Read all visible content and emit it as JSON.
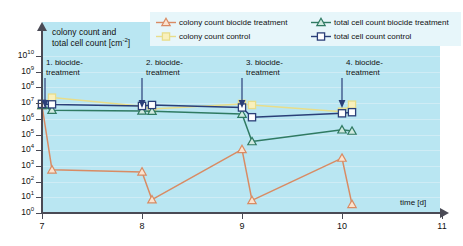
{
  "chart_data": {
    "type": "line",
    "title": "",
    "xlabel": "time [d]",
    "ylabel": "colony count and total cell count [cm⁻²]",
    "ylabel_line1": "colony count and",
    "ylabel_line2": "total cell count [cm",
    "ylabel_exp": "-2",
    "ylabel_line2_end": "]",
    "xlim": [
      7,
      11
    ],
    "ylim_log10": [
      0,
      10
    ],
    "xticks": [
      "7",
      "8",
      "9",
      "10",
      "11"
    ],
    "yticks": [
      "10⁰",
      "10¹",
      "10²",
      "10³",
      "10⁴",
      "10⁵",
      "10⁶",
      "10⁷",
      "10⁸",
      "10⁹",
      "10¹⁰"
    ],
    "ytick_exponents": [
      "0",
      "1",
      "2",
      "3",
      "4",
      "5",
      "6",
      "7",
      "8",
      "9",
      "10"
    ],
    "grid": true,
    "legend_position": "top",
    "background_color": "#b9e6f2",
    "series": [
      {
        "name": "colony count biocide treatment",
        "color": "#d98b63",
        "marker": "triangle",
        "marker_fill": "#fbe3cf",
        "points": [
          {
            "x": 7.0,
            "y_log10": 6.85
          },
          {
            "x": 7.1,
            "y_log10": 2.75
          },
          {
            "x": 8.0,
            "y_log10": 2.62
          },
          {
            "x": 8.1,
            "y_log10": 0.85
          },
          {
            "x": 9.0,
            "y_log10": 4.05
          },
          {
            "x": 9.1,
            "y_log10": 0.8
          },
          {
            "x": 10.0,
            "y_log10": 3.5
          },
          {
            "x": 10.1,
            "y_log10": 0.55
          }
        ]
      },
      {
        "name": "colony count control",
        "color": "#e8dd8a",
        "marker": "square",
        "marker_fill": "#f9f0bc",
        "points": [
          {
            "x": 7.0,
            "y_log10": 6.95
          },
          {
            "x": 7.1,
            "y_log10": 7.35
          },
          {
            "x": 8.0,
            "y_log10": 6.8
          },
          {
            "x": 8.1,
            "y_log10": 6.62
          },
          {
            "x": 9.0,
            "y_log10": 6.95
          },
          {
            "x": 9.1,
            "y_log10": 6.88
          },
          {
            "x": 10.0,
            "y_log10": 6.45
          },
          {
            "x": 10.1,
            "y_log10": 6.9
          }
        ]
      },
      {
        "name": "total cell count biocide treatment",
        "color": "#2f7a62",
        "marker": "triangle",
        "marker_fill": "#cfe9df",
        "points": [
          {
            "x": 7.0,
            "y_log10": 6.85
          },
          {
            "x": 7.1,
            "y_log10": 6.55
          },
          {
            "x": 8.0,
            "y_log10": 6.5
          },
          {
            "x": 8.1,
            "y_log10": 6.48
          },
          {
            "x": 9.0,
            "y_log10": 6.3
          },
          {
            "x": 9.1,
            "y_log10": 4.55
          },
          {
            "x": 10.0,
            "y_log10": 5.3
          },
          {
            "x": 10.1,
            "y_log10": 5.22
          }
        ]
      },
      {
        "name": "total cell count control",
        "color": "#2b3f78",
        "marker": "square",
        "marker_fill": "#ffffff",
        "points": [
          {
            "x": 7.0,
            "y_log10": 6.95
          },
          {
            "x": 7.1,
            "y_log10": 6.92
          },
          {
            "x": 8.0,
            "y_log10": 6.82
          },
          {
            "x": 8.1,
            "y_log10": 6.88
          },
          {
            "x": 9.0,
            "y_log10": 6.72
          },
          {
            "x": 9.1,
            "y_log10": 6.1
          },
          {
            "x": 10.0,
            "y_log10": 6.35
          },
          {
            "x": 10.1,
            "y_log10": 6.42
          }
        ]
      }
    ],
    "annotations": [
      {
        "id": "t1",
        "line1": "1. biocide-",
        "line2": "treatment",
        "x": 7.0
      },
      {
        "id": "t2",
        "line1": "2. biocide-",
        "line2": "treatment",
        "x": 8.0
      },
      {
        "id": "t3",
        "line1": "3. biocide-",
        "line2": "treatment",
        "x": 9.0
      },
      {
        "id": "t4",
        "line1": "4. biocide-",
        "line2": "treatment",
        "x": 10.0
      }
    ]
  },
  "legend": {
    "items": [
      {
        "label": "colony count biocide treatment",
        "color": "#d98b63",
        "marker": "triangle"
      },
      {
        "label": "total cell count biocide treatment",
        "color": "#2f7a62",
        "marker": "triangle"
      },
      {
        "label": "colony count control",
        "color": "#e8dd8a",
        "marker": "square"
      },
      {
        "label": "total cell count control",
        "color": "#2b3f78",
        "marker": "square"
      }
    ]
  },
  "colors": {
    "panel_background": "#b9e6f2",
    "legend_background": "#e7f6fa",
    "axis": "#4a4a55",
    "gridline": "#cfecf5",
    "colony_biocide": "#d98b63",
    "colony_control": "#e8dd8a",
    "total_biocide": "#2f7a62",
    "total_control": "#2b3f78"
  }
}
